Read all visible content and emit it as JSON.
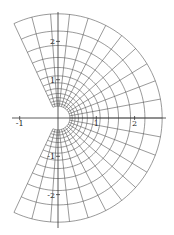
{
  "chart_data": {
    "type": "line",
    "title": "",
    "xlabel": "",
    "ylabel": "",
    "xlim": [
      -1.2,
      2.8
    ],
    "ylim": [
      -2.9,
      2.8
    ],
    "grid": false,
    "x_ticks": [
      {
        "value": -1,
        "label": "-1"
      },
      {
        "value": 1,
        "label": "1"
      },
      {
        "value": 2,
        "label": "2"
      }
    ],
    "y_ticks": [
      {
        "value": 2,
        "label": "2"
      },
      {
        "value": 1,
        "label": "1"
      },
      {
        "value": -1,
        "label": "-1"
      },
      {
        "value": -2,
        "label": "-2"
      }
    ],
    "mesh": {
      "r_min": 0.31,
      "r_max": 2.72,
      "radial_steps": 12,
      "radial_spacing": "geometric",
      "theta_min_deg": -115,
      "theta_max_deg": 115,
      "angular_steps": 22
    },
    "line_color": "#555555",
    "axis_color": "#333333"
  },
  "axes_px": {
    "origin_x": 58,
    "origin_y": 118,
    "unit_px": 38.3,
    "x_start": 12,
    "x_end": 166,
    "y_start": 12,
    "y_end": 228
  }
}
